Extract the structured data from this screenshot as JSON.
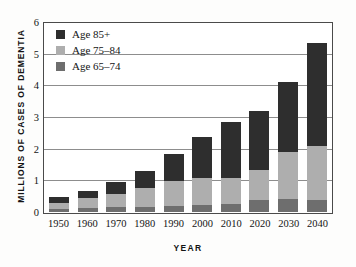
{
  "chart_data": {
    "type": "bar",
    "stacked": true,
    "title": "",
    "xlabel": "YEAR",
    "ylabel": "MILLIONS OF CASES OF DEMENTIA",
    "categories": [
      "1950",
      "1960",
      "1970",
      "1980",
      "1990",
      "2000",
      "2010",
      "2020",
      "2030",
      "2040"
    ],
    "ylim": [
      0,
      6
    ],
    "yticks": [
      "0",
      "1",
      "2",
      "3",
      "4",
      "5",
      "6"
    ],
    "grid": true,
    "legend_position": "top-left",
    "series": [
      {
        "name": "Age 65-74",
        "color": "#6e6e6e",
        "values": [
          0.1,
          0.13,
          0.16,
          0.17,
          0.2,
          0.22,
          0.26,
          0.38,
          0.41,
          0.39
        ]
      },
      {
        "name": "Age 75-84",
        "color": "#aeaeae",
        "values": [
          0.2,
          0.32,
          0.4,
          0.58,
          0.77,
          0.85,
          0.83,
          0.95,
          1.47,
          1.71
        ]
      },
      {
        "name": "Age 85+",
        "color": "#2e2e2e",
        "values": [
          0.18,
          0.22,
          0.38,
          0.56,
          0.86,
          1.31,
          1.76,
          1.87,
          2.22,
          3.25
        ]
      }
    ],
    "totals": [
      0.48,
      0.67,
      0.94,
      1.31,
      1.83,
      2.38,
      2.85,
      3.2,
      4.1,
      5.35
    ]
  },
  "legend": {
    "items": [
      {
        "label": "Age 85+",
        "color": "#2e2e2e"
      },
      {
        "label": "Age 75–84",
        "color": "#aeaeae"
      },
      {
        "label": "Age 65–74",
        "color": "#6e6e6e"
      }
    ]
  },
  "axes": {
    "x_title": "YEAR",
    "y_title": "MILLIONS OF CASES OF DEMENTIA"
  },
  "colors": {
    "frame": "#4a4a4a",
    "gridline": "#8d8d8d",
    "background": "#fdfdfc",
    "plot_background": "#ffffff",
    "text": "#141414"
  }
}
